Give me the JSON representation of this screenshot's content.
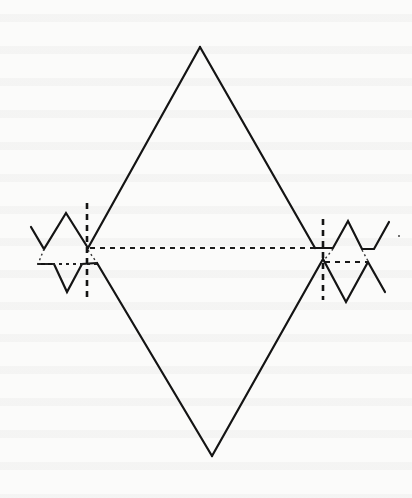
{
  "figure": {
    "type": "line-drawing",
    "stroke_color": "#141414",
    "background_color": "#fbfbfa",
    "labels": []
  },
  "shapes": {
    "rhombus": {
      "top": [
        200,
        47
      ],
      "left_upper": [
        88,
        248
      ],
      "left_lower": [
        97,
        263
      ],
      "bottom": [
        212,
        456
      ],
      "right_lower": [
        323,
        259
      ],
      "right_upper": [
        315,
        248
      ]
    },
    "left_zigzag_upper": [
      [
        31,
        227
      ],
      [
        44,
        249
      ],
      [
        66,
        213
      ],
      [
        88,
        248
      ]
    ],
    "left_zigzag_lower": [
      [
        38,
        264
      ],
      [
        54,
        264
      ],
      [
        67,
        292
      ],
      [
        82,
        264
      ],
      [
        97,
        263
      ]
    ],
    "right_zigzag_upper": [
      [
        315,
        248
      ],
      [
        333,
        248
      ],
      [
        348,
        221
      ],
      [
        362,
        249
      ],
      [
        374,
        249
      ],
      [
        389,
        222
      ]
    ],
    "right_zigzag_lower": [
      [
        323,
        259
      ],
      [
        346,
        302
      ],
      [
        368,
        262
      ],
      [
        385,
        292
      ]
    ],
    "left_vertical_axis": {
      "x": 87,
      "y1": 203,
      "y2": 298
    },
    "right_vertical_axis": {
      "x": 323,
      "y1": 219,
      "y2": 300
    },
    "center_dashed_line": {
      "y": 248,
      "x1": 88,
      "x2": 320
    },
    "left_dotted_line": {
      "y": 264,
      "x1": 38,
      "x2": 97
    },
    "right_dashed_line": {
      "y": 262,
      "x1": 323,
      "x2": 368
    }
  }
}
